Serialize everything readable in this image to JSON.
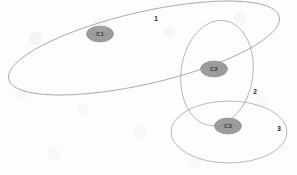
{
  "figure": {
    "type": "cluster-boundary-diagram",
    "background_color": "#fdfdfc",
    "width": 297,
    "height": 175
  },
  "clusters": [
    {
      "id": "c1",
      "label": "C1",
      "cx": 100,
      "cy": 34,
      "rx": 13.5,
      "ry": 8,
      "rotation": 0,
      "fill": "#9c9c9c",
      "stroke": "#8a8a8a",
      "text_color": "#3a3a3a"
    },
    {
      "id": "c2",
      "label": "C2",
      "cx": 214,
      "cy": 69,
      "rx": 13.5,
      "ry": 8,
      "rotation": 0,
      "fill": "#9c9c9c",
      "stroke": "#8a8a8a",
      "text_color": "#3a3a3a"
    },
    {
      "id": "c3",
      "label": "C3",
      "cx": 228,
      "cy": 126,
      "rx": 13.5,
      "ry": 8,
      "rotation": 0,
      "fill": "#9c9c9c",
      "stroke": "#8a8a8a",
      "text_color": "#3a3a3a"
    }
  ],
  "boundaries": [
    {
      "id": "boundary-1",
      "label": "1",
      "cx": 144,
      "cy": 48,
      "rx": 139,
      "ry": 36,
      "rotation": -13,
      "stroke": "#8e8e96",
      "stroke_width": 0.7,
      "label_x": 156,
      "label_y": 18
    },
    {
      "id": "boundary-2",
      "label": "2",
      "cx": 217,
      "cy": 73,
      "rx": 36,
      "ry": 53,
      "rotation": 8,
      "stroke": "#9a9aa4",
      "stroke_width": 0.7,
      "label_x": 255,
      "label_y": 91
    },
    {
      "id": "boundary-3",
      "label": "3",
      "cx": 229,
      "cy": 132,
      "rx": 58,
      "ry": 31,
      "rotation": 0,
      "stroke": "#9a9aa4",
      "stroke_width": 0.7,
      "label_x": 279,
      "label_y": 128
    }
  ]
}
